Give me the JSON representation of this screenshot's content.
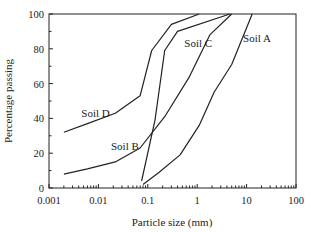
{
  "chart_data": {
    "type": "line",
    "title": "",
    "xlabel": "Particle size (mm)",
    "ylabel": "Percentage passing",
    "xscale": "log",
    "xlim": [
      0.001,
      100
    ],
    "ylim": [
      0,
      100
    ],
    "xticks": [
      0.001,
      0.01,
      0.1,
      1,
      10,
      100
    ],
    "xtick_labels": [
      "0.001",
      "0.01",
      "0.1",
      "1",
      "10",
      "100"
    ],
    "yticks": [
      0,
      20,
      40,
      60,
      80,
      100
    ],
    "ytick_labels": [
      "0",
      "20",
      "40",
      "60",
      "80",
      "100"
    ],
    "grid": false,
    "legend": "none (inline series labels)",
    "series": [
      {
        "name": "Soil A",
        "x": [
          0.08,
          0.17,
          0.45,
          1.1,
          2.2,
          5,
          13
        ],
        "y": [
          2,
          9,
          19,
          36,
          55,
          71,
          100
        ],
        "label_pos": [
          8.5,
          84
        ]
      },
      {
        "name": "Soil B",
        "x": [
          0.002,
          0.006,
          0.022,
          0.07,
          0.22,
          0.7,
          1.8,
          5
        ],
        "y": [
          8,
          11,
          15,
          23,
          41,
          64,
          88,
          100
        ],
        "label_pos": [
          0.018,
          22
        ]
      },
      {
        "name": "Soil C",
        "x": [
          0.075,
          0.14,
          0.22,
          0.4,
          4.6
        ],
        "y": [
          4,
          39,
          79,
          90,
          100
        ],
        "label_pos": [
          0.55,
          81
        ]
      },
      {
        "name": "Soil D",
        "x": [
          0.002,
          0.006,
          0.022,
          0.07,
          0.12,
          0.3,
          1.1
        ],
        "y": [
          32,
          37,
          43,
          53,
          79,
          94,
          100
        ],
        "label_pos": [
          0.0045,
          41
        ]
      }
    ]
  }
}
